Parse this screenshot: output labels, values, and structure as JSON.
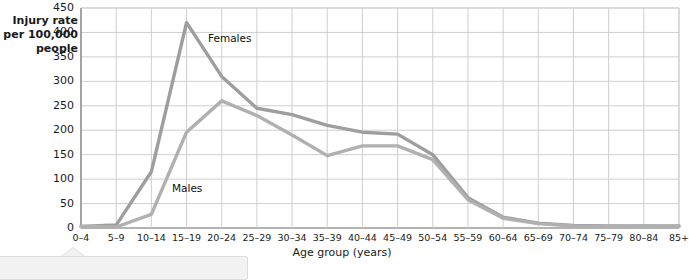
{
  "chart_data": {
    "type": "line",
    "title": "",
    "subtitle": "",
    "ylabel": "Injury rate\nper 100,000\npeople",
    "ylabel_lines": [
      "Injury rate",
      "per 100,000",
      "people"
    ],
    "xlabel": "Age group (years)",
    "categories": [
      "0–4",
      "5–9",
      "10–14",
      "15–19",
      "20–24",
      "25–29",
      "30–34",
      "35–39",
      "40–44",
      "45–49",
      "50–54",
      "55–59",
      "60–64",
      "65–69",
      "70–74",
      "75–79",
      "80–84",
      "85+"
    ],
    "yticks": [
      0,
      50,
      100,
      150,
      200,
      250,
      300,
      350,
      400,
      450
    ],
    "ylim": [
      0,
      450
    ],
    "grid": true,
    "legend_position": "inline-annotations",
    "series": [
      {
        "name": "Females",
        "color": "#9e9e9e",
        "values": [
          3,
          6,
          115,
          420,
          310,
          245,
          232,
          210,
          196,
          192,
          150,
          62,
          22,
          10,
          5,
          4,
          4,
          4
        ]
      },
      {
        "name": "Males",
        "color": "#b0b0b0",
        "values": [
          3,
          2,
          28,
          196,
          260,
          230,
          190,
          148,
          168,
          168,
          140,
          58,
          20,
          9,
          4,
          3,
          3,
          3
        ]
      }
    ],
    "annotations": [
      {
        "text": "Females",
        "series": "Females"
      },
      {
        "text": "Males",
        "series": "Males"
      }
    ]
  },
  "colors": {
    "line_female": "#9e9e9e",
    "line_male": "#b3b3b3",
    "grid": "#cfcfcf",
    "axis": "#9a9a9a",
    "text": "#1a1a1a",
    "callout_bg": "#f2f2f2",
    "callout_border": "#dddddd"
  }
}
